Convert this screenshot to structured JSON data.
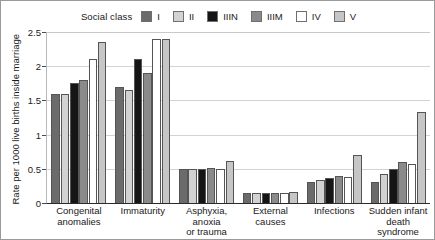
{
  "chart_data": {
    "type": "bar",
    "title": "",
    "subtitle": "",
    "xlabel": "",
    "ylabel": "Rate per 1000 live births inside marriage",
    "legend_title": "Social class",
    "legend_position": "top-center",
    "grid": true,
    "ylim": [
      0,
      2.5
    ],
    "ytick_labels": [
      "0",
      "0.5",
      "1",
      "1.5",
      "2",
      "2.5"
    ],
    "ytick_values": [
      0,
      0.5,
      1,
      1.5,
      2,
      2.5
    ],
    "categories": [
      "Congenital\nanomalies",
      "Immaturity",
      "Asphyxia,\nanoxia\nor trauma",
      "External\ncauses",
      "Infections",
      "Sudden infant\ndeath\nsyndrome"
    ],
    "series": [
      {
        "name": "I",
        "color": "#6b6b6b",
        "values": [
          1.6,
          1.7,
          0.5,
          0.14,
          0.3,
          0.3
        ]
      },
      {
        "name": "II",
        "color": "#d2d2d2",
        "values": [
          1.6,
          1.65,
          0.5,
          0.15,
          0.33,
          0.42
        ]
      },
      {
        "name": "IIIN",
        "color": "#151515",
        "values": [
          1.75,
          2.1,
          0.5,
          0.15,
          0.37,
          0.5
        ]
      },
      {
        "name": "IIIM",
        "color": "#8a8a8a",
        "values": [
          1.8,
          1.9,
          0.51,
          0.15,
          0.4,
          0.6
        ]
      },
      {
        "name": "IV",
        "color": "#ffffff",
        "values": [
          2.1,
          2.4,
          0.5,
          0.14,
          0.38,
          0.57
        ]
      },
      {
        "name": "V",
        "color": "#c6c6c6",
        "values": [
          2.35,
          2.4,
          0.62,
          0.16,
          0.7,
          1.33
        ]
      }
    ]
  }
}
